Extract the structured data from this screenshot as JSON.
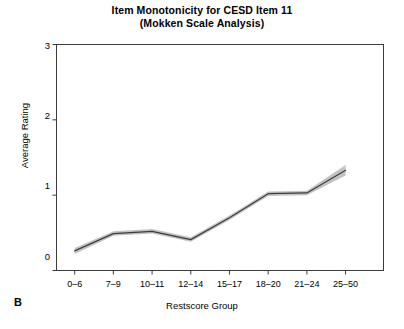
{
  "figure": {
    "panel_label": "B",
    "title": "Item Monotonicity for CESD Item 11",
    "subtitle": "(Mokken Scale Analysis)"
  },
  "chart_data": {
    "type": "line",
    "title": "Item Monotonicity for CESD Item 11",
    "subtitle": "(Mokken Scale Analysis)",
    "xlabel": "Restscore Group",
    "ylabel": "Average Rating",
    "categories": [
      "0–6",
      "7–9",
      "10–11",
      "12–14",
      "15–17",
      "18–20",
      "21–24",
      "25–50"
    ],
    "values": [
      0.26,
      0.49,
      0.52,
      0.41,
      0.7,
      1.02,
      1.03,
      1.33
    ],
    "series": [
      {
        "name": "Average Rating",
        "values": [
          0.26,
          0.49,
          0.52,
          0.41,
          0.7,
          1.02,
          1.03,
          1.33
        ],
        "color": "#3c3c3c"
      }
    ],
    "confidence_band": {
      "name": "Confidence band",
      "color": "#b8b8b8",
      "lower": [
        0.22,
        0.46,
        0.49,
        0.38,
        0.67,
        0.99,
        1.0,
        1.26
      ],
      "upper": [
        0.3,
        0.52,
        0.55,
        0.44,
        0.73,
        1.05,
        1.06,
        1.4
      ]
    },
    "yticks": [
      0,
      1,
      2,
      3
    ],
    "ytick_labels": [
      "0",
      "1",
      "2",
      "3"
    ],
    "ylim": [
      0,
      3
    ],
    "xlim": [
      0.5,
      8.5
    ],
    "grid": false,
    "legend": "none",
    "box": true
  },
  "colors": {
    "axis": "#3c3c3c",
    "line": "#3c3c3c",
    "band": "#b8b8b8",
    "background": "#ffffff"
  }
}
